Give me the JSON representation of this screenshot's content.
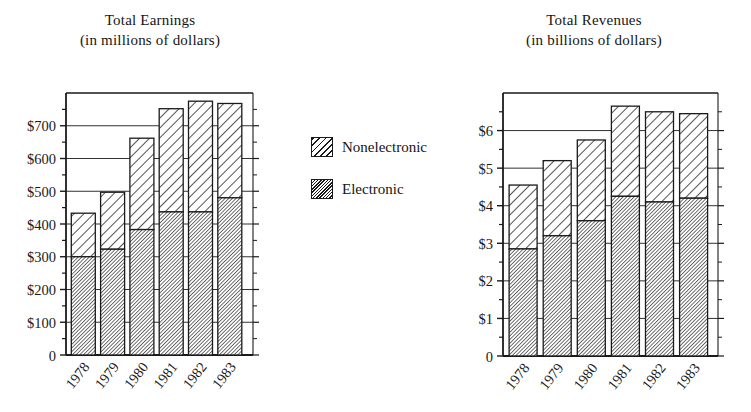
{
  "figure": {
    "background_color": "#ffffff",
    "ink_color": "#1a1a1a"
  },
  "legend": {
    "items": [
      {
        "label": "Nonelectronic",
        "pattern": "wide-diagonal-hatch",
        "swatch_name": "legend-swatch-nonelectronic"
      },
      {
        "label": "Electronic",
        "pattern": "dense-diagonal-hatch",
        "swatch_name": "legend-swatch-electronic"
      }
    ]
  },
  "chart_data": [
    {
      "id": "earnings",
      "type": "bar",
      "stacked": true,
      "title": "Total Earnings",
      "subtitle": "(in millions of dollars)",
      "xlabel": "",
      "ylabel": "",
      "categories": [
        "1978",
        "1979",
        "1980",
        "1981",
        "1982",
        "1983"
      ],
      "ytick_labels": [
        "0",
        "$100",
        "$200",
        "$300",
        "$400",
        "$500",
        "$600",
        "$700"
      ],
      "ytick_values": [
        0,
        100,
        200,
        300,
        400,
        500,
        600,
        700
      ],
      "ylim": [
        0,
        800
      ],
      "grid": "horizontal-major",
      "minor_ticks": true,
      "legend_position": "center-between-panels",
      "series": [
        {
          "name": "Electronic",
          "values": [
            300,
            323,
            383,
            437,
            437,
            480
          ]
        },
        {
          "name": "Nonelectronic",
          "values": [
            133,
            174,
            279,
            315,
            338,
            288
          ]
        }
      ],
      "totals": [
        433,
        497,
        662,
        752,
        775,
        768
      ]
    },
    {
      "id": "revenues",
      "type": "bar",
      "stacked": true,
      "title": "Total Revenues",
      "subtitle": "(in billions of dollars)",
      "xlabel": "",
      "ylabel": "",
      "categories": [
        "1978",
        "1979",
        "1980",
        "1981",
        "1982",
        "1983"
      ],
      "ytick_labels": [
        "0",
        "$1",
        "$2",
        "$3",
        "$4",
        "$5",
        "$6"
      ],
      "ytick_values": [
        0,
        1,
        2,
        3,
        4,
        5,
        6
      ],
      "ylim": [
        0,
        7
      ],
      "grid": "horizontal-major",
      "minor_ticks": true,
      "legend_position": "center-between-panels",
      "series": [
        {
          "name": "Electronic",
          "values": [
            2.85,
            3.2,
            3.6,
            4.25,
            4.1,
            4.2
          ]
        },
        {
          "name": "Nonelectronic",
          "values": [
            1.7,
            2.0,
            2.15,
            2.4,
            2.4,
            2.25
          ]
        }
      ],
      "totals": [
        4.55,
        5.2,
        5.75,
        6.65,
        6.5,
        6.45
      ]
    }
  ]
}
